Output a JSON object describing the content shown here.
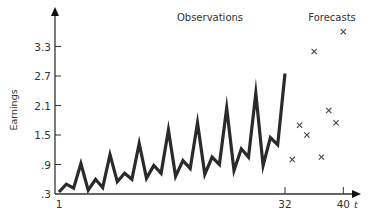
{
  "chart_data": {
    "type": "line",
    "title": "",
    "xlabel": "t",
    "ylabel": "Earnings",
    "section_labels": [
      "Observations",
      "Forecasts"
    ],
    "x_ticks": [
      "1",
      "32",
      "40"
    ],
    "y_ticks": [
      ".3",
      ".9",
      "1.5",
      "2.1",
      "2.7",
      "3.3"
    ],
    "xlim": [
      1,
      40
    ],
    "ylim": [
      0.3,
      3.6
    ],
    "grid": false,
    "legend": "none",
    "series": [
      {
        "name": "Observations",
        "style": "line",
        "x": [
          1,
          2,
          3,
          4,
          5,
          6,
          7,
          8,
          9,
          10,
          11,
          12,
          13,
          14,
          15,
          16,
          17,
          18,
          19,
          20,
          21,
          22,
          23,
          24,
          25,
          26,
          27,
          28,
          29,
          30,
          31,
          32
        ],
        "values": [
          0.34,
          0.5,
          0.42,
          0.92,
          0.38,
          0.6,
          0.43,
          1.1,
          0.55,
          0.72,
          0.6,
          1.33,
          0.62,
          0.88,
          0.72,
          1.6,
          0.66,
          0.98,
          0.82,
          1.75,
          0.7,
          1.05,
          0.9,
          2.05,
          0.78,
          1.22,
          1.05,
          2.35,
          0.88,
          1.45,
          1.3,
          2.75
        ]
      },
      {
        "name": "Forecasts",
        "style": "marker-x",
        "x": [
          33,
          34,
          35,
          36,
          37,
          38,
          39,
          40
        ],
        "values": [
          1.0,
          1.7,
          1.5,
          3.2,
          1.05,
          2.0,
          1.75,
          3.6
        ]
      }
    ]
  },
  "labels": {
    "observations": "Observations",
    "forecasts": "Forecasts",
    "ylabel": "Earnings",
    "xlabel": "t"
  },
  "colors": {
    "line": "#2a2a2a",
    "axis": "#333333",
    "marker": "#444444"
  }
}
